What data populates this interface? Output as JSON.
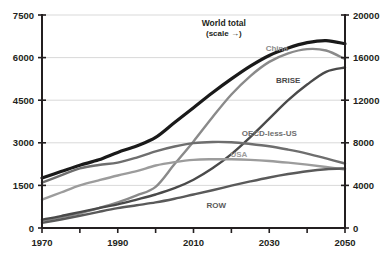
{
  "chart_data": {
    "type": "line",
    "title": "",
    "xlabel": "",
    "ylabel": "",
    "xlim": [
      1970,
      2050
    ],
    "ylim": [
      0,
      7500
    ],
    "ylim_right": [
      0,
      20000
    ],
    "grid": true,
    "legend": "inline-labels",
    "x_ticks": [
      1970,
      1980,
      1990,
      2000,
      2010,
      2020,
      2030,
      2040,
      2050
    ],
    "x_tick_labels": [
      "1970",
      "",
      "1990",
      "",
      "2010",
      "",
      "2030",
      "",
      "2050"
    ],
    "y_ticks_left": [
      0,
      1500,
      3000,
      4500,
      6000,
      7500
    ],
    "y_tick_labels_left": [
      "0",
      "1500",
      "3000",
      "4500",
      "6000",
      "7500"
    ],
    "y_ticks_right": [
      0,
      4000,
      8000,
      12000,
      16000,
      20000
    ],
    "y_tick_labels_right": [
      "0",
      "4000",
      "8000",
      "12000",
      "16000",
      "20000"
    ],
    "x": [
      1970,
      1975,
      1980,
      1985,
      1990,
      1995,
      2000,
      2005,
      2010,
      2015,
      2020,
      2025,
      2030,
      2035,
      2040,
      2045,
      2050
    ],
    "series": [
      {
        "name": "World total",
        "label": "World total",
        "sublabel": "(scale →)",
        "axis": "right",
        "color": "#1a1a1a",
        "width": 3.2,
        "label_x": 2018,
        "label_y": 19000,
        "values": [
          4700,
          5300,
          5900,
          6400,
          7100,
          7700,
          8500,
          9900,
          11300,
          12700,
          14000,
          15200,
          16200,
          16900,
          17400,
          17600,
          17300
        ]
      },
      {
        "name": "China",
        "label": "China",
        "axis": "left",
        "color": "#8a8a8a",
        "width": 2.4,
        "label_x": 2032,
        "label_y": 6250,
        "values": [
          250,
          380,
          520,
          700,
          900,
          1150,
          1450,
          2250,
          3050,
          3900,
          4700,
          5350,
          5850,
          6150,
          6300,
          6250,
          5950
        ]
      },
      {
        "name": "BRISE",
        "label": "BRISE",
        "axis": "left",
        "color": "#4a4a4a",
        "width": 2.4,
        "label_x": 2035,
        "label_y": 5100,
        "values": [
          300,
          420,
          560,
          700,
          830,
          1000,
          1180,
          1400,
          1700,
          2100,
          2600,
          3200,
          3850,
          4500,
          5050,
          5500,
          5650
        ]
      },
      {
        "name": "OECD-less-US",
        "label": "OECD-less-US",
        "axis": "left",
        "color": "#6e6e6e",
        "width": 2.4,
        "label_x": 2030,
        "label_y": 3250,
        "values": [
          1600,
          1850,
          2100,
          2220,
          2300,
          2480,
          2700,
          2870,
          2990,
          3030,
          3020,
          2960,
          2880,
          2760,
          2620,
          2450,
          2270
        ]
      },
      {
        "name": "USA",
        "label": "USA",
        "axis": "left",
        "color": "#9c9c9c",
        "width": 2.4,
        "label_x": 2022,
        "label_y": 2500,
        "values": [
          1000,
          1250,
          1500,
          1680,
          1850,
          2000,
          2200,
          2320,
          2400,
          2420,
          2420,
          2400,
          2360,
          2300,
          2230,
          2150,
          2060
        ]
      },
      {
        "name": "ROW",
        "label": "ROW",
        "axis": "left",
        "color": "#5a5a5a",
        "width": 2.4,
        "label_x": 2016,
        "label_y": 700,
        "values": [
          180,
          300,
          430,
          570,
          700,
          800,
          900,
          1030,
          1180,
          1330,
          1490,
          1640,
          1780,
          1900,
          2000,
          2070,
          2100
        ]
      }
    ]
  },
  "axes": {
    "left_axis_name": "left-value-axis",
    "right_axis_name": "right-value-axis",
    "bottom_axis_name": "year-axis"
  }
}
